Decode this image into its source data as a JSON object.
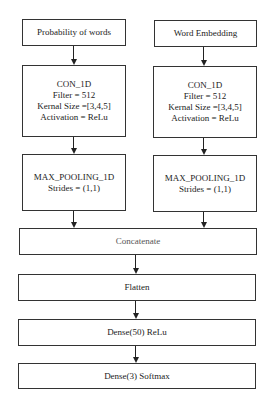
{
  "diagram": {
    "type": "flowchart",
    "left_branch": {
      "input": "Probability of words",
      "conv": [
        "CON_1D",
        "Filter = 512",
        "Kernal Size =[3,4,5]",
        "Activation = ReLu"
      ],
      "pool": [
        "MAX_POOLING_1D",
        "Strides = (1,1)"
      ]
    },
    "right_branch": {
      "input": "Word Embedding",
      "conv": [
        "CON_1D",
        "Filter = 512",
        "Kernal Size =[3,4,5]",
        "Activation = ReLu"
      ],
      "pool": [
        "MAX_POOLING_1D",
        "Strides = (1,1)"
      ]
    },
    "shared": {
      "concatenate": "Concatenate",
      "flatten": "Flatten",
      "dense1": "Dense(50) ReLu",
      "dense2": "Dense(3) Softmax"
    },
    "edges": [
      [
        "Probability of words",
        "CON_1D (left)"
      ],
      [
        "CON_1D (left)",
        "MAX_POOLING_1D (left)"
      ],
      [
        "MAX_POOLING_1D (left)",
        "Concatenate"
      ],
      [
        "Word Embedding",
        "CON_1D (right)"
      ],
      [
        "CON_1D (right)",
        "MAX_POOLING_1D (right)"
      ],
      [
        "MAX_POOLING_1D (right)",
        "Concatenate"
      ],
      [
        "Concatenate",
        "Flatten"
      ],
      [
        "Flatten",
        "Dense(50) ReLu"
      ],
      [
        "Dense(50) ReLu",
        "Dense(3) Softmax"
      ]
    ]
  }
}
